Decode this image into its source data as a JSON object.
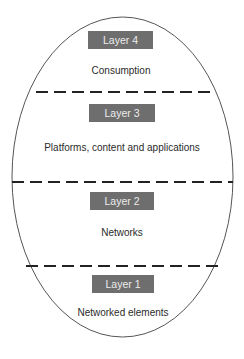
{
  "diagram": {
    "type": "layered-ellipse",
    "colors": {
      "background": "#ffffff",
      "outline": "#555555",
      "divider": "#222222",
      "box_fill": "#6e6e6e",
      "box_text": "#ececec",
      "desc_text": "#2b2b2b"
    },
    "ellipse": {
      "cx": 122.5,
      "cy": 177,
      "rx": 110.5,
      "ry": 160
    },
    "layers": [
      {
        "label": "Layer 4",
        "description": "Consumption"
      },
      {
        "label": "Layer 3",
        "description": "Platforms, content and applications"
      },
      {
        "label": "Layer 2",
        "description": "Networks"
      },
      {
        "label": "Layer 1",
        "description": "Networked elements"
      }
    ],
    "dividers": [
      {
        "style": "dashed",
        "between": [
          "Layer 4",
          "Layer 3"
        ]
      },
      {
        "style": "dashed",
        "between": [
          "Layer 3",
          "Layer 2"
        ]
      },
      {
        "style": "dashed",
        "between": [
          "Layer 2",
          "Layer 1"
        ]
      }
    ]
  }
}
